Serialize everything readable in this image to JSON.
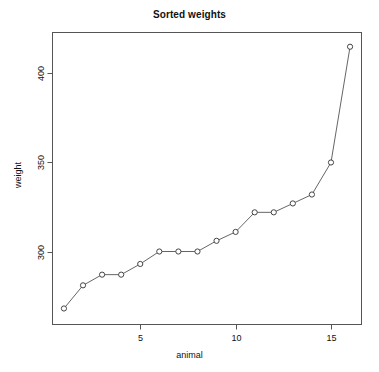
{
  "chart_data": {
    "type": "line",
    "title": "Sorted weights",
    "xlabel": "animal",
    "ylabel": "weight",
    "x": [
      1,
      2,
      3,
      4,
      5,
      6,
      7,
      8,
      9,
      10,
      11,
      12,
      13,
      14,
      15,
      16
    ],
    "values": [
      268,
      281,
      287,
      287,
      293,
      300,
      300,
      300,
      306,
      311,
      322,
      322,
      327,
      332,
      350,
      415
    ],
    "series": [
      {
        "name": "weight",
        "values": [
          268,
          281,
          287,
          287,
          293,
          300,
          300,
          300,
          306,
          311,
          322,
          322,
          327,
          332,
          350,
          415
        ]
      }
    ],
    "x_ticks": [
      5,
      10,
      15
    ],
    "x_tick_labels": [
      "5",
      "10",
      "15"
    ],
    "y_ticks": [
      300,
      350,
      400
    ],
    "y_tick_labels": [
      "300",
      "350",
      "400"
    ],
    "xlim": [
      0.4,
      16.6
    ],
    "ylim": [
      259,
      423
    ],
    "grid": false,
    "legend": false,
    "marker": "open-circle",
    "line_color": "#666666",
    "marker_edge_color": "#444444",
    "marker_face_color": "#ffffff",
    "axis_color": "#555555",
    "text_color": "#111111",
    "background": "#ffffff"
  }
}
